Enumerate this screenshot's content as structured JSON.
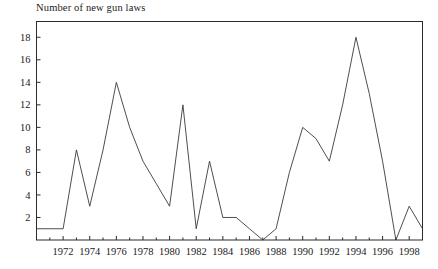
{
  "chart_data": {
    "type": "line",
    "title": "Number of new gun laws",
    "xlabel": "",
    "ylabel": "",
    "x": [
      1970,
      1971,
      1972,
      1973,
      1974,
      1975,
      1976,
      1977,
      1978,
      1979,
      1980,
      1981,
      1982,
      1983,
      1984,
      1985,
      1986,
      1987,
      1988,
      1989,
      1990,
      1991,
      1992,
      1993,
      1994,
      1995,
      1996,
      1997,
      1998,
      1999
    ],
    "values": [
      1,
      1,
      1,
      8,
      3,
      8,
      14,
      10,
      7,
      5,
      3,
      12,
      1,
      7,
      2,
      2,
      1,
      0,
      1,
      6,
      10,
      9,
      7,
      12,
      18,
      13,
      7,
      0,
      3,
      1
    ],
    "series": [
      {
        "name": "New gun laws",
        "values": [
          1,
          1,
          1,
          8,
          3,
          8,
          14,
          10,
          7,
          5,
          3,
          12,
          1,
          7,
          2,
          2,
          1,
          0,
          1,
          6,
          10,
          9,
          7,
          12,
          18,
          13,
          7,
          0,
          3,
          1
        ]
      }
    ],
    "xlim": [
      1970,
      1999
    ],
    "ylim": [
      0,
      19.4
    ],
    "ytick_labels": [
      "2",
      "4",
      "6",
      "8",
      "10",
      "12",
      "14",
      "16",
      "18"
    ],
    "yticks": [
      2,
      4,
      6,
      8,
      10,
      12,
      14,
      16,
      18
    ],
    "xtick_labels": [
      "1972",
      "1974",
      "1976",
      "1978",
      "1980",
      "1982",
      "1984",
      "1986",
      "1988",
      "1990",
      "1992",
      "1994",
      "1996",
      "1998"
    ],
    "xticks": [
      1972,
      1974,
      1976,
      1978,
      1980,
      1982,
      1984,
      1986,
      1988,
      1990,
      1992,
      1994,
      1996,
      1998
    ],
    "xminor_ticks": [
      1971,
      1973,
      1975,
      1977,
      1979,
      1981,
      1983,
      1985,
      1987,
      1989,
      1991,
      1993,
      1995,
      1997,
      1999
    ],
    "grid": false,
    "legend": false,
    "line_color": "#3a3a3a",
    "frame_color": "#2b2b2b",
    "background_color": "#ffffff"
  }
}
